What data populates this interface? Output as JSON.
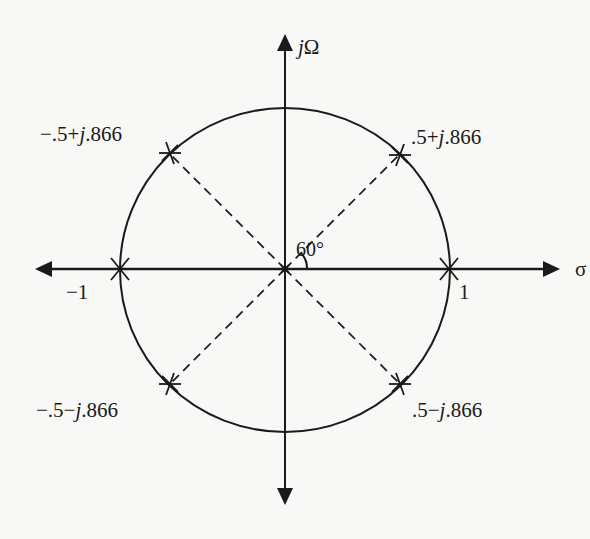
{
  "diagram": {
    "type": "s-plane pole plot",
    "axes": {
      "vertical_label_prefix": "j",
      "vertical_label_symbol": "Ω",
      "horizontal_label": "σ"
    },
    "unit_circle": {
      "radius": 1
    },
    "angle_label": "60°",
    "ticks": {
      "neg_one": "−1",
      "pos_one": "1"
    },
    "poles": [
      {
        "id": "p1",
        "re": "−.5",
        "sign": "+",
        "im": ".866",
        "label_pre": "−.5+",
        "label_j": "j",
        "label_post": ".866"
      },
      {
        "id": "p2",
        "re": ".5",
        "sign": "+",
        "im": ".866",
        "label_pre": ".5+",
        "label_j": "j",
        "label_post": ".866"
      },
      {
        "id": "p3",
        "re": "−.5",
        "sign": "−",
        "im": ".866",
        "label_pre": "−.5−",
        "label_j": "j",
        "label_post": ".866"
      },
      {
        "id": "p4",
        "re": ".5",
        "sign": "−",
        "im": ".866",
        "label_pre": ".5−",
        "label_j": "j",
        "label_post": ".866"
      },
      {
        "id": "p5",
        "re": "−1",
        "im": "0"
      },
      {
        "id": "p6",
        "re": "1",
        "im": "0"
      }
    ],
    "colors": {
      "ink": "#1a1a1a",
      "paper": "#f8f8f6"
    }
  }
}
